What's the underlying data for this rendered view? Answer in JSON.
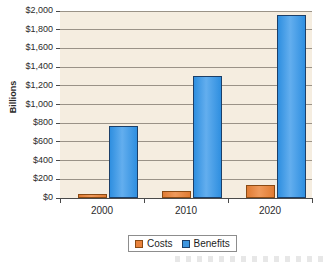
{
  "chart_data": {
    "type": "bar",
    "title": "",
    "xlabel": "",
    "ylabel": "Billions",
    "categories": [
      "2000",
      "2010",
      "2020"
    ],
    "series": [
      {
        "name": "Costs",
        "color": "#E8823C",
        "values": [
          40,
          70,
          140
        ]
      },
      {
        "name": "Benefits",
        "color": "#3D96E0",
        "values": [
          770,
          1300,
          1960
        ]
      }
    ],
    "ylim": [
      0,
      2000
    ],
    "ytick_step": 200,
    "ytick_labels": [
      "$0",
      "$200",
      "$400",
      "$600",
      "$800",
      "$1,000",
      "$1,200",
      "$1,400",
      "$1,600",
      "$1,800",
      "$2,000"
    ],
    "grid": true,
    "legend_position": "bottom-center",
    "plot_background": "#F5EDE0",
    "gridline_color": "#9A9287"
  },
  "legend": {
    "entries": [
      {
        "label": "Costs"
      },
      {
        "label": "Benefits"
      }
    ]
  },
  "axes": {
    "y_title": "Billions"
  }
}
